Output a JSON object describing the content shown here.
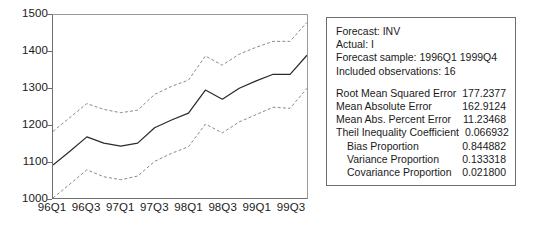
{
  "chart_data": {
    "type": "line",
    "title": "",
    "xlabel": "",
    "ylabel": "",
    "ylim": [
      1000,
      1500
    ],
    "yticks": [
      1000,
      1100,
      1200,
      1300,
      1400,
      1500
    ],
    "grid": false,
    "legend": "none",
    "x": [
      "1996Q1",
      "1996Q2",
      "1996Q3",
      "1996Q4",
      "1997Q1",
      "1997Q2",
      "1997Q3",
      "1997Q4",
      "1998Q1",
      "1998Q2",
      "1998Q3",
      "1998Q4",
      "1999Q1",
      "1999Q2",
      "1999Q3",
      "1999Q4"
    ],
    "xtick_labels": [
      "96Q1",
      "96Q3",
      "97Q1",
      "97Q3",
      "98Q1",
      "98Q3",
      "99Q1",
      "99Q3"
    ],
    "xtick_indices": [
      0,
      2,
      4,
      6,
      8,
      10,
      12,
      14
    ],
    "series": [
      {
        "name": "INV forecast",
        "style": "solid",
        "color": "#2b2b2b",
        "values": [
          1090,
          1128,
          1167,
          1150,
          1142,
          1150,
          1192,
          1213,
          1232,
          1295,
          1270,
          1300,
          1320,
          1338,
          1338,
          1390
        ]
      },
      {
        "name": "Upper 2 S.E. band",
        "style": "dashed",
        "color": "#8a8a8a",
        "values": [
          1182,
          1220,
          1258,
          1242,
          1233,
          1240,
          1283,
          1305,
          1322,
          1388,
          1363,
          1393,
          1412,
          1428,
          1428,
          1480
        ]
      },
      {
        "name": "Lower 2 S.E. band",
        "style": "dashed",
        "color": "#8a8a8a",
        "values": [
          1000,
          1038,
          1077,
          1058,
          1050,
          1060,
          1100,
          1122,
          1140,
          1202,
          1178,
          1208,
          1228,
          1248,
          1245,
          1300
        ]
      }
    ]
  },
  "stats_panel": {
    "header_lines": [
      "Forecast: INV",
      "Actual: I",
      "Forecast sample: 1996Q1 1999Q4",
      "Included observations: 16"
    ],
    "metrics": [
      {
        "label": "Root Mean Squared Error",
        "value": "177.2377",
        "indent": false
      },
      {
        "label": "Mean Absolute Error",
        "value": "162.9124",
        "indent": false
      },
      {
        "label": "Mean Abs. Percent Error",
        "value": "11.23468",
        "indent": false
      },
      {
        "label": "Theil Inequality Coefficient",
        "value": "0.066932",
        "indent": false
      },
      {
        "label": "Bias Proportion",
        "value": "0.844882",
        "indent": true
      },
      {
        "label": "Variance Proportion",
        "value": "0.133318",
        "indent": true
      },
      {
        "label": "Covariance Proportion",
        "value": "0.021800",
        "indent": true
      }
    ]
  }
}
